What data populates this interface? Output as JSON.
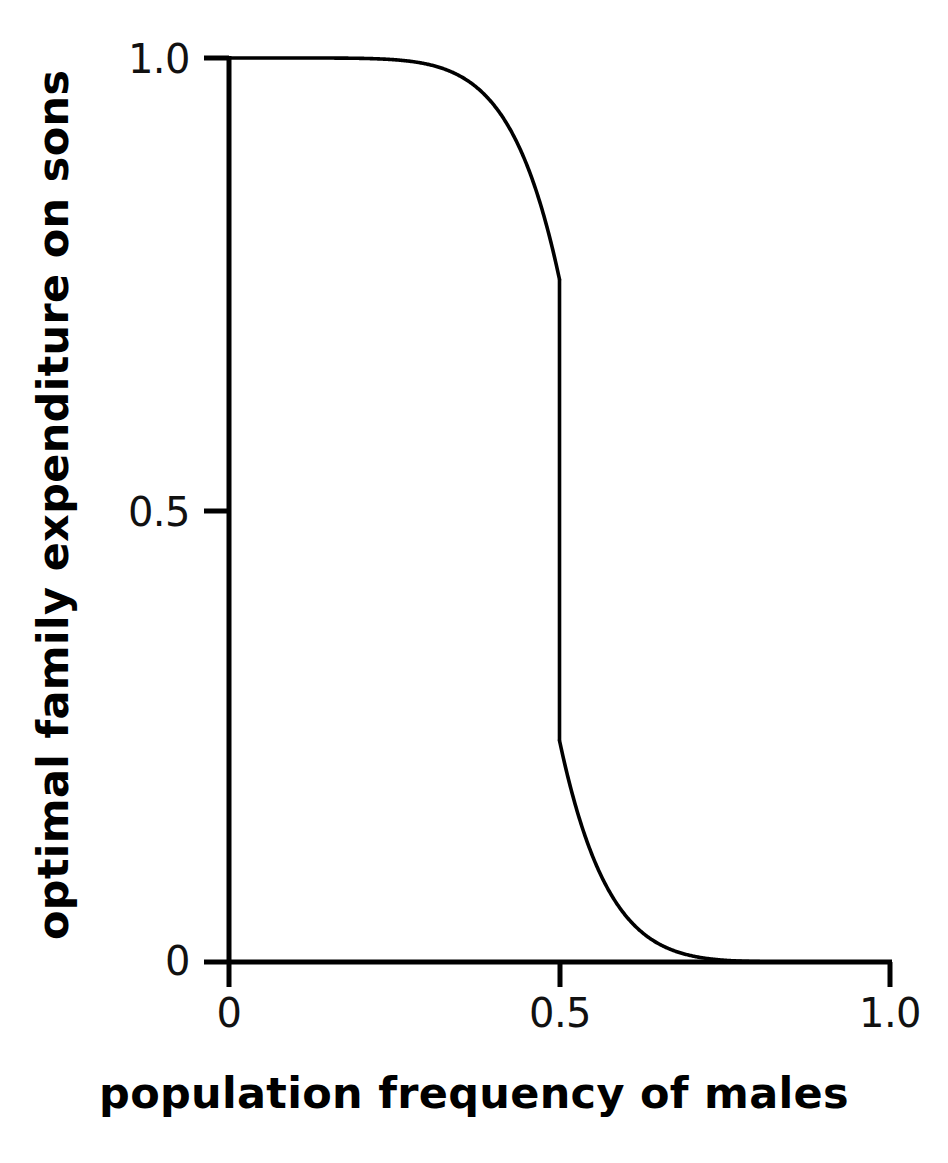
{
  "figure": {
    "background_color": "#ffffff",
    "ink_color": "#000000"
  },
  "chart_data": {
    "type": "line",
    "title": "",
    "subtitle": "",
    "xlabel": "population frequency of males",
    "ylabel": "optimal family expenditure on sons",
    "xlim": [
      0,
      1
    ],
    "ylim": [
      0,
      1
    ],
    "grid": false,
    "legend": null,
    "legend_position": "none",
    "xticks": [
      0,
      0.5,
      1
    ],
    "xticklabels": [
      "0",
      "0.5",
      "1.0"
    ],
    "yticks": [
      0,
      0.5,
      1
    ],
    "yticklabels": [
      "0",
      "0.5",
      "1.0"
    ],
    "annotations": [],
    "series": [
      {
        "name": "optimal expenditure on sons",
        "style": "solid",
        "color": "#000000",
        "line_width": 3,
        "discontinuous": true,
        "description": "Monotone decreasing curve with a near-vertical jump at x = 0.5; point-symmetric about (0.5, 0.5).",
        "branches": [
          {
            "name": "upper-branch",
            "x_range": [
              0,
              0.5
            ],
            "points": [
              [
                0.0,
                1.0
              ],
              [
                0.02,
                0.999
              ],
              [
                0.05,
                0.997
              ],
              [
                0.08,
                0.993
              ],
              [
                0.1,
                0.99
              ],
              [
                0.13,
                0.984
              ],
              [
                0.15,
                0.979
              ],
              [
                0.18,
                0.97
              ],
              [
                0.2,
                0.963
              ],
              [
                0.23,
                0.951
              ],
              [
                0.25,
                0.941
              ],
              [
                0.28,
                0.925
              ],
              [
                0.3,
                0.912
              ],
              [
                0.33,
                0.89
              ],
              [
                0.35,
                0.873
              ],
              [
                0.38,
                0.945
              ],
              [
                0.38,
                0.944
              ],
              [
                0.4,
                0.925
              ],
              [
                0.42,
                0.899
              ],
              [
                0.44,
                0.868
              ],
              [
                0.46,
                0.83
              ],
              [
                0.47,
                0.812
              ],
              [
                0.48,
                0.793
              ],
              [
                0.49,
                0.775
              ],
              [
                0.495,
                0.765
              ],
              [
                0.5,
                0.755
              ]
            ]
          },
          {
            "name": "vertical-jump",
            "x_range": [
              0.5,
              0.5
            ],
            "points": [
              [
                0.5,
                0.755
              ],
              [
                0.5,
                0.245
              ]
            ]
          },
          {
            "name": "lower-branch",
            "x_range": [
              0.5,
              1.0
            ],
            "points": [
              [
                0.5,
                0.245
              ],
              [
                0.505,
                0.235
              ],
              [
                0.51,
                0.225
              ],
              [
                0.52,
                0.207
              ],
              [
                0.53,
                0.188
              ],
              [
                0.54,
                0.17
              ],
              [
                0.56,
                0.132
              ],
              [
                0.58,
                0.101
              ],
              [
                0.6,
                0.075
              ],
              [
                0.62,
                0.058
              ],
              [
                0.65,
                0.04
              ],
              [
                0.67,
                0.033
              ],
              [
                0.7,
                0.025
              ],
              [
                0.75,
                0.015
              ],
              [
                0.8,
                0.009
              ],
              [
                0.85,
                0.005
              ],
              [
                0.9,
                0.003
              ],
              [
                0.95,
                0.001
              ],
              [
                1.0,
                0.0
              ]
            ]
          }
        ]
      }
    ]
  },
  "axes": {
    "x_tick_labels": {
      "t0": "0",
      "t1": "0.5",
      "t2": "1.0"
    },
    "y_tick_labels": {
      "t0": "0",
      "t1": "0.5",
      "t2": "1.0"
    },
    "x_title": "population frequency of males",
    "y_title": "optimal family expenditure on sons"
  }
}
